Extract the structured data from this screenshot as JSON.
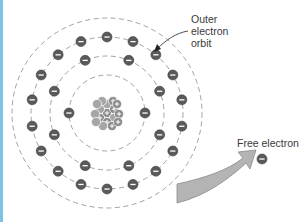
{
  "diagram": {
    "colors": {
      "border": "#7ec3e3",
      "orbit": "#8a8a8a",
      "electron_fill": "#5a5a5a",
      "electron_stroke": "#3f3f3f",
      "nucleus_proton": "#8c8c8c",
      "nucleus_neutron": "#a6a6a6",
      "arrow_fill": "#b4b4b4",
      "arrow_stroke": "#7a7a7a",
      "text": "#3a3a3a"
    },
    "atom": {
      "center": [
        107,
        113
      ],
      "orbits": [
        {
          "radius": 38,
          "electrons": 2
        },
        {
          "radius": 57,
          "electrons": 8
        },
        {
          "radius": 76,
          "electrons": 18
        },
        {
          "radius": 95,
          "electrons": 0,
          "label": "Outer electron orbit"
        }
      ],
      "nucleus": {
        "particles": 15,
        "charge_symbol": "+"
      }
    },
    "labels": {
      "outer_orbit_line1": "Outer",
      "outer_orbit_line2": "electron",
      "outer_orbit_line3": "orbit",
      "free_electron": "Free electron"
    },
    "electron_symbol": "−",
    "free_electron": {
      "position": [
        262,
        159
      ]
    }
  }
}
